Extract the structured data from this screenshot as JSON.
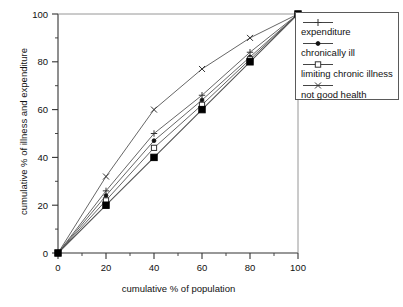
{
  "chart_data": {
    "type": "line",
    "title": "",
    "xlabel": "cumulative % of population",
    "ylabel": "cumulative % of illness and expenditure",
    "xlim": [
      0,
      100
    ],
    "ylim": [
      0,
      100
    ],
    "xticks": [
      0,
      20,
      40,
      60,
      80,
      100
    ],
    "yticks": [
      0,
      20,
      40,
      60,
      80,
      100
    ],
    "minor_tick_step": 10,
    "grid": false,
    "legend_position": "top-right-outside",
    "x": [
      0,
      20,
      40,
      60,
      80,
      100
    ],
    "series": [
      {
        "name": "expenditure",
        "marker": "plus",
        "values": [
          0,
          26,
          50,
          66,
          84,
          100
        ]
      },
      {
        "name": "chronically ill",
        "marker": "dot",
        "values": [
          0,
          24,
          47,
          64,
          82,
          100
        ]
      },
      {
        "name": "limiting chronic illness",
        "marker": "open-square",
        "values": [
          0,
          22,
          44,
          62,
          81,
          100
        ]
      },
      {
        "name": "not good health",
        "marker": "cross",
        "values": [
          0,
          32,
          60,
          77,
          90,
          100
        ]
      },
      {
        "name": "line of equality",
        "marker": "filled-square",
        "values": [
          0,
          20,
          40,
          60,
          80,
          100
        ]
      }
    ],
    "colors": {
      "line": "#555555",
      "axis": "#333333",
      "marker_fill": "#000000",
      "background": "#ffffff"
    }
  },
  "legend": {
    "entries": [
      {
        "label": "expenditure",
        "icon": "plus-marker-icon"
      },
      {
        "label": "chronically ill",
        "icon": "dot-marker-icon"
      },
      {
        "label": "limiting chronic illness",
        "icon": "open-square-marker-icon"
      },
      {
        "label": "not good health",
        "icon": "cross-marker-icon"
      }
    ]
  },
  "axes": {
    "x_title": "cumulative % of population",
    "y_title": "cumulative % of illness and expenditure",
    "x_tick_labels": [
      "0",
      "20",
      "40",
      "60",
      "80",
      "100"
    ],
    "y_tick_labels": [
      "0",
      "20",
      "40",
      "60",
      "80",
      "100"
    ]
  }
}
